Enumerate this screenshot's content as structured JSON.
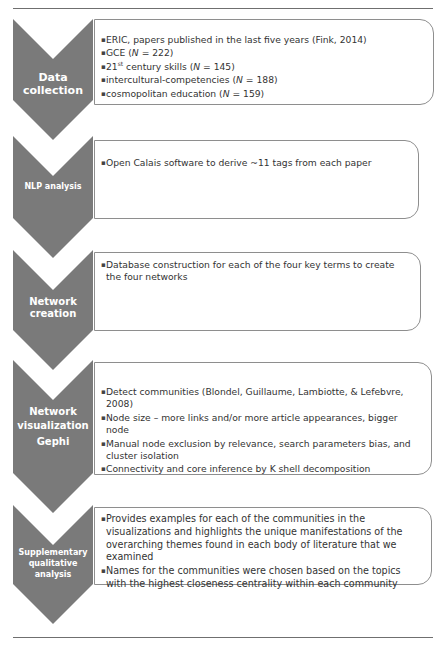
{
  "header": {
    "cut_title": "Global Citizenship Education Methodology"
  },
  "steps": [
    {
      "id": "data-collection",
      "label_lines": [
        "Data collection"
      ],
      "items": [
        {
          "pre": "ERIC, papers published in the last five years (Fink, 2014)",
          "sup": "",
          "mid": "",
          "n_label": "",
          "post": ""
        },
        {
          "pre": "GCE (",
          "sup": "",
          "mid": "",
          "n_label": "N",
          "post": " = 222)"
        },
        {
          "pre": "21",
          "sup": "st",
          "mid": " century skills (",
          "n_label": "N",
          "post": " = 145)"
        },
        {
          "pre": "intercultural-competencies (",
          "sup": "",
          "mid": "",
          "n_label": "N",
          "post": " = 188)"
        },
        {
          "pre": "cosmopolitan education (",
          "sup": "",
          "mid": "",
          "n_label": "N",
          "post": " = 159)"
        }
      ]
    },
    {
      "id": "nlp-analysis",
      "label_lines": [
        "NLP analysis"
      ],
      "items": [
        {
          "pre": "Open Calais software to derive ~11 tags from each paper",
          "sup": "",
          "mid": "",
          "n_label": "",
          "post": ""
        }
      ]
    },
    {
      "id": "network-creation",
      "label_lines": [
        "Network",
        "creation"
      ],
      "items": [
        {
          "pre": "Database construction for each of the four key terms to create the four networks",
          "sup": "",
          "mid": "",
          "n_label": "",
          "post": ""
        }
      ]
    },
    {
      "id": "network-visualization",
      "label_lines": [
        "Network",
        "visualization",
        "Gephi"
      ],
      "items": [
        {
          "pre": "Detect communities (Blondel, Guillaume, Lambiotte, & Lefebvre, 2008)",
          "sup": "",
          "mid": "",
          "n_label": "",
          "post": ""
        },
        {
          "pre": "Node size – more links and/or more article appearances, bigger node",
          "sup": "",
          "mid": "",
          "n_label": "",
          "post": ""
        },
        {
          "pre": "Manual node exclusion by relevance, search parameters bias, and cluster isolation",
          "sup": "",
          "mid": "",
          "n_label": "",
          "post": ""
        },
        {
          "pre": "Connectivity and core inference by K shell decomposition",
          "sup": "",
          "mid": "",
          "n_label": "",
          "post": ""
        }
      ]
    },
    {
      "id": "supplementary-qualitative-analysis",
      "label_lines": [
        "Supplementary",
        "qualitative",
        "analysis"
      ],
      "items": [
        {
          "pre": "Provides examples for each of the communities in the visualizations and highlights the unique manifestations of the overarching themes found in each body of literature that we examined",
          "sup": "",
          "mid": "",
          "n_label": "",
          "post": ""
        },
        {
          "pre": "Names for the communities were chosen based on the topics with the highest closeness centrality within each community",
          "sup": "",
          "mid": "",
          "n_label": "",
          "post": ""
        }
      ]
    }
  ],
  "colors": {
    "chevron_fill": "#7a7a7a",
    "box_border": "#8e8e8e",
    "text": "#333333",
    "label_text": "#ffffff"
  }
}
